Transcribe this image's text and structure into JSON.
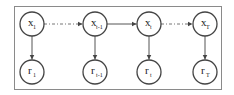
{
  "diagram": {
    "type": "graphical-model-chain",
    "nodes": [
      {
        "id": "x1",
        "base": "x",
        "sub": "1",
        "cx": 32,
        "cy": 24
      },
      {
        "id": "xtm1",
        "base": "x",
        "sub": "t-1",
        "cx": 95,
        "cy": 24
      },
      {
        "id": "xt",
        "base": "x",
        "sub": "t",
        "cx": 149,
        "cy": 24
      },
      {
        "id": "xT",
        "base": "x",
        "sub": "T",
        "cx": 205,
        "cy": 24
      },
      {
        "id": "r1",
        "base": "r",
        "sub": "1",
        "cx": 32,
        "cy": 72
      },
      {
        "id": "rtm1",
        "base": "r",
        "sub": "t-1",
        "cx": 95,
        "cy": 72
      },
      {
        "id": "rt",
        "base": "r",
        "sub": "t",
        "cx": 149,
        "cy": 72
      },
      {
        "id": "rT",
        "base": "r",
        "sub": "T",
        "cx": 205,
        "cy": 72
      }
    ],
    "edges": [
      {
        "from": "x1",
        "to": "xtm1",
        "style": "dash-dot"
      },
      {
        "from": "xtm1",
        "to": "xt",
        "style": "solid"
      },
      {
        "from": "xt",
        "to": "xT",
        "style": "dash-dot"
      },
      {
        "from": "x1",
        "to": "r1",
        "style": "solid"
      },
      {
        "from": "xtm1",
        "to": "rtm1",
        "style": "solid"
      },
      {
        "from": "xt",
        "to": "rt",
        "style": "solid"
      },
      {
        "from": "xT",
        "to": "rT",
        "style": "solid"
      }
    ],
    "colors": {
      "stroke": "#444444",
      "frame": "#8a8a8a",
      "background": "#ffffff"
    }
  }
}
